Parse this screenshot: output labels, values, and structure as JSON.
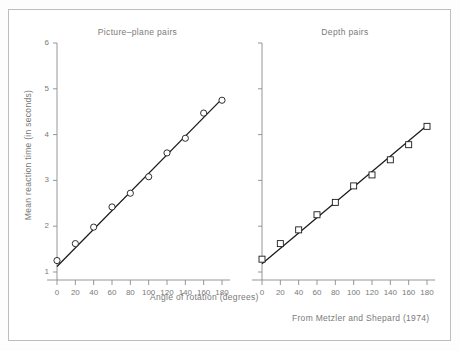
{
  "figure": {
    "credit": "From Metzler and Shepard (1974)",
    "ylabel": "Mean reaction time (in seconds)",
    "xlabel": "Angle of rotation (degrees)"
  },
  "chart_data": {
    "type": "scatter",
    "title": "",
    "xlabel": "Angle of rotation (degrees)",
    "ylabel": "Mean reaction time (in seconds)",
    "xlim": [
      0,
      180
    ],
    "ylim": [
      1,
      6
    ],
    "xticks": [
      0,
      20,
      40,
      60,
      80,
      100,
      120,
      140,
      160,
      180
    ],
    "xticklabels": [
      "0",
      "20",
      "40",
      "60",
      "80",
      "100",
      "120",
      "140",
      "160",
      "180"
    ],
    "yticks": [
      1,
      2,
      3,
      4,
      5,
      6
    ],
    "yticklabels": [
      "1",
      "2",
      "3",
      "4",
      "5",
      "6"
    ],
    "grid": false,
    "legend": "none",
    "panels": [
      {
        "title": "Picture–plane pairs",
        "marker": "circle",
        "x": [
          0,
          20,
          40,
          60,
          80,
          100,
          120,
          140,
          160,
          180
        ],
        "y": [
          1.25,
          1.62,
          1.98,
          2.42,
          2.72,
          3.08,
          3.6,
          3.92,
          4.47,
          4.75
        ],
        "fit_line": {
          "x0": 0,
          "y0": 1.12,
          "x1": 180,
          "y1": 4.78
        }
      },
      {
        "title": "Depth pairs",
        "marker": "square",
        "x": [
          0,
          20,
          40,
          60,
          80,
          100,
          120,
          140,
          160,
          180
        ],
        "y": [
          1.28,
          1.62,
          1.92,
          2.25,
          2.52,
          2.88,
          3.12,
          3.45,
          3.78,
          4.18
        ],
        "fit_line": {
          "x0": 0,
          "y0": 1.18,
          "x1": 180,
          "y1": 4.2
        }
      }
    ]
  }
}
